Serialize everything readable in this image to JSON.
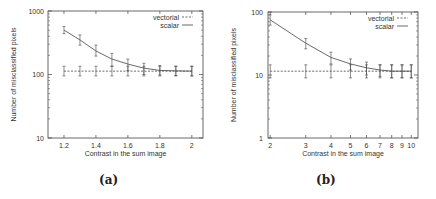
{
  "captions": {
    "a": "(a)",
    "b": "(b)"
  },
  "chart_data": [
    {
      "type": "line",
      "panel": "(a)",
      "xlabel": "Contrast in the sum image",
      "ylabel": "Number of misclassified pixels",
      "x_scale": "linear",
      "y_scale": "log",
      "xlim": [
        1.1,
        2.07
      ],
      "ylim": [
        10,
        1000
      ],
      "x_ticks": [
        1.2,
        1.4,
        1.6,
        1.8,
        2
      ],
      "x_tick_labels": [
        "1.2",
        "1.4",
        "1.6",
        "1.8",
        "2"
      ],
      "y_ticks": [
        10,
        100,
        1000
      ],
      "y_tick_labels": [
        "10",
        "100",
        "1000"
      ],
      "legend": [
        "vectorial",
        "scalar"
      ],
      "legend_position": "top-right",
      "grid": false,
      "x": [
        1.2,
        1.3,
        1.4,
        1.5,
        1.6,
        1.7,
        1.8,
        1.9,
        2.0
      ],
      "series": [
        {
          "name": "vectorial",
          "style": "dashed",
          "values": [
            113,
            113,
            113,
            113,
            113,
            113,
            113,
            113,
            113
          ],
          "err_low": [
            95,
            95,
            95,
            95,
            95,
            95,
            95,
            95,
            95
          ],
          "err_high": [
            135,
            135,
            135,
            135,
            135,
            135,
            135,
            135,
            135
          ]
        },
        {
          "name": "scalar",
          "style": "solid",
          "values": [
            500,
            350,
            235,
            175,
            146,
            126,
            116,
            114,
            113
          ],
          "err_low": [
            440,
            290,
            195,
            135,
            115,
            100,
            98,
            96,
            95
          ],
          "err_high": [
            570,
            420,
            290,
            215,
            175,
            150,
            138,
            135,
            135
          ]
        }
      ]
    },
    {
      "type": "line",
      "panel": "(b)",
      "xlabel": "Contrast in the sum image",
      "ylabel": "Number of misclassified pixels",
      "x_scale": "log",
      "y_scale": "log",
      "xlim": [
        1.95,
        10.8
      ],
      "ylim": [
        1,
        100
      ],
      "x_ticks": [
        2,
        3,
        4,
        5,
        6,
        7,
        8,
        9,
        10
      ],
      "x_tick_labels": [
        "2",
        "3",
        "4",
        "5",
        "6",
        "7",
        "8",
        "9",
        "10"
      ],
      "y_ticks": [
        1,
        10,
        100
      ],
      "y_tick_labels": [
        "1",
        "10",
        "100"
      ],
      "legend": [
        "vectorial",
        "scalar"
      ],
      "legend_position": "top-right",
      "grid": false,
      "x": [
        2,
        3,
        4,
        5,
        6,
        7,
        8,
        9,
        10
      ],
      "series": [
        {
          "name": "vectorial",
          "style": "dashed",
          "values": [
            11.5,
            11.5,
            11.5,
            11.5,
            11.5,
            11.5,
            11.5,
            11.5,
            11.5
          ],
          "err_low": [
            9,
            9,
            9,
            9,
            9,
            9,
            9,
            9,
            9
          ],
          "err_high": [
            14.5,
            14.5,
            14.5,
            14.5,
            14.5,
            14.5,
            14.5,
            14.5,
            14.5
          ]
        },
        {
          "name": "scalar",
          "style": "solid",
          "values": [
            75,
            32,
            19,
            15,
            13,
            12,
            11.5,
            11.5,
            11.5
          ],
          "err_low": [
            62,
            26,
            15,
            12,
            10,
            9.5,
            9,
            9,
            9
          ],
          "err_high": [
            90,
            38,
            23,
            18,
            16,
            14.5,
            14.5,
            14.5,
            14.5
          ]
        }
      ]
    }
  ]
}
